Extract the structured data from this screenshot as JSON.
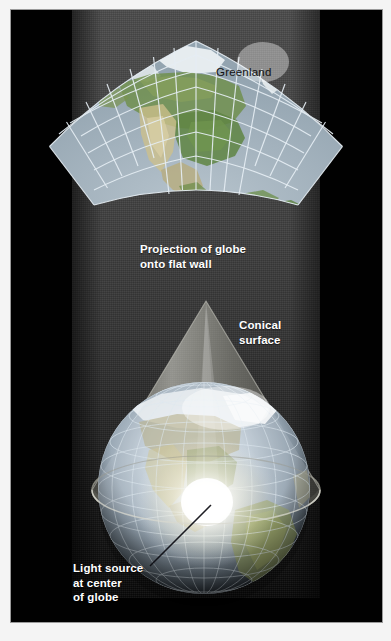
{
  "figure": {
    "type": "conic-map-projection-diagram",
    "background_color": "#000000",
    "frame_color": "#f4f4f4",
    "wall_color": "#3e3e3e"
  },
  "labels": {
    "greenland": "Greenland",
    "projection": "Projection of globe\nonto flat wall",
    "conical": "Conical\nsurface",
    "light_source": "Light source\nat center\nof globe"
  },
  "elements": {
    "fan_name": "conic-projection-fan",
    "cone_name": "conical-surface",
    "globe_name": "globe",
    "wall_name": "flat-wall-panel",
    "pointer_name": "light-source-pointer"
  },
  "colors": {
    "map_land_green": "#6f8f4a",
    "map_land_tan": "#c8bc88",
    "map_ocean": "#9fb0bd",
    "graticule": "#e8f0f5",
    "cone_surface": "#8f8f88",
    "light_core": "#ffffff",
    "label_text": "#ffffff",
    "greenland_text": "#121212"
  }
}
